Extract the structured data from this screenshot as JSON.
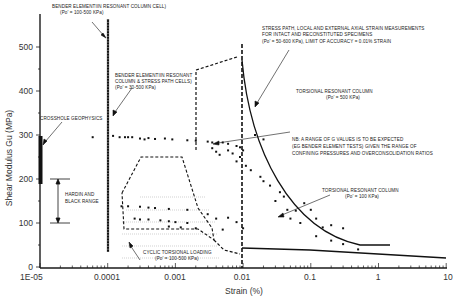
{
  "chart_data": {
    "type": "scatter",
    "title": "",
    "xlabel": "Strain (%)",
    "ylabel": "Shear Modulus Gu (MPa)",
    "xscale": "log",
    "xlim": [
      1e-05,
      10
    ],
    "ylim": [
      0,
      550
    ],
    "x_tick_labels": [
      "1E-05",
      "0.0001",
      "0.001",
      "0.01",
      "0.1",
      "1",
      "10"
    ],
    "y_tick_labels": [
      "0",
      "100",
      "200",
      "300",
      "400",
      "500"
    ],
    "grid": false,
    "legend": "none",
    "series": [
      {
        "name": "Crosshole geophysics",
        "kind": "vertical-bar",
        "x": 1e-05,
        "y_range": [
          180,
          320
        ]
      },
      {
        "name": "Bender element in resonant column cell",
        "kind": "vertical-line",
        "x": 0.0001,
        "y_range": [
          35,
          555
        ]
      },
      {
        "name": "Hardin and Black range",
        "kind": "range-bracket",
        "x": 2e-05,
        "y_range": [
          100,
          200
        ]
      },
      {
        "name": "Stress path (local strain) data",
        "kind": "scatter",
        "points": [
          [
            6e-05,
            295
          ],
          [
            0.00012,
            298
          ],
          [
            0.00015,
            295
          ],
          [
            0.00018,
            295
          ],
          [
            0.0002,
            295
          ],
          [
            0.00023,
            295
          ],
          [
            0.0003,
            292
          ],
          [
            0.00035,
            290
          ],
          [
            0.0004,
            293
          ],
          [
            0.0005,
            291
          ],
          [
            0.0007,
            292
          ],
          [
            0.0009,
            290
          ],
          [
            0.0015,
            288
          ],
          [
            0.002,
            287
          ],
          [
            0.003,
            285
          ],
          [
            0.0035,
            283
          ],
          [
            0.005,
            283
          ],
          [
            0.006,
            280
          ],
          [
            0.008,
            275
          ],
          [
            0.009,
            272
          ],
          [
            0.01,
            265
          ],
          [
            0.0035,
            270
          ],
          [
            0.004,
            262
          ],
          [
            0.006,
            265
          ],
          [
            0.007,
            258
          ],
          [
            0.009,
            250
          ],
          [
            0.008,
            240
          ],
          [
            0.0045,
            255
          ],
          [
            0.011,
            230
          ],
          [
            0.013,
            220
          ]
        ]
      },
      {
        "name": "Cyclic torsional loading",
        "kind": "scatter",
        "points": [
          [
            0.00016,
            138
          ],
          [
            0.0002,
            138
          ],
          [
            0.0003,
            137
          ],
          [
            0.0004,
            135
          ],
          [
            0.0005,
            134
          ],
          [
            0.0008,
            132
          ],
          [
            0.0015,
            130
          ],
          [
            0.00025,
            110
          ],
          [
            0.0003,
            108
          ],
          [
            0.0004,
            108
          ],
          [
            0.0006,
            106
          ],
          [
            0.0008,
            104
          ],
          [
            0.001,
            102
          ],
          [
            0.0015,
            100
          ],
          [
            0.0008,
            92
          ],
          [
            0.0012,
            90
          ],
          [
            0.002,
            88
          ]
        ]
      },
      {
        "name": "Torsional resonant column (Po'=100 kPa) data",
        "kind": "scatter",
        "points": [
          [
            0.003,
            120
          ],
          [
            0.004,
            110
          ],
          [
            0.006,
            112
          ],
          [
            0.008,
            102
          ],
          [
            0.01,
            88
          ],
          [
            0.005,
            85
          ],
          [
            0.015,
            300
          ],
          [
            0.02,
            290
          ],
          [
            0.018,
            205
          ],
          [
            0.02,
            195
          ],
          [
            0.025,
            185
          ],
          [
            0.035,
            170
          ],
          [
            0.04,
            160
          ],
          [
            0.03,
            150
          ],
          [
            0.045,
            130
          ],
          [
            0.06,
            128
          ],
          [
            0.08,
            145
          ],
          [
            0.1,
            130
          ],
          [
            0.05,
            110
          ],
          [
            0.07,
            100
          ],
          [
            0.12,
            110
          ],
          [
            0.15,
            90
          ],
          [
            0.2,
            95
          ],
          [
            0.3,
            88
          ],
          [
            0.12,
            70
          ],
          [
            0.2,
            60
          ],
          [
            0.3,
            52
          ],
          [
            0.5,
            40
          ]
        ]
      },
      {
        "name": "Torsional resonant column (Po'=500 kPa) curve",
        "kind": "line",
        "x": [
          0.013,
          0.02,
          0.05,
          0.1,
          0.3,
          1,
          3
        ],
        "y": [
          460,
          340,
          230,
          160,
          80,
          45,
          35
        ]
      },
      {
        "name": "Torsional resonant column (Po'=100 kPa) curve",
        "kind": "line",
        "x": [
          0.013,
          0.1,
          1,
          10
        ],
        "y": [
          40,
          32,
          25,
          20
        ]
      },
      {
        "name": "Cyclic torsional loading envelope",
        "kind": "dashed-polygon",
        "x": [
          0.00014,
          0.0002,
          0.0012,
          0.004,
          0.013,
          0.005,
          0.0025,
          0.00016
        ],
        "y": [
          190,
          275,
          275,
          100,
          40,
          55,
          85,
          88
        ]
      },
      {
        "name": "Stress path local/external axial strain envelope",
        "kind": "dashed-polygon",
        "x": [
          0.003,
          0.013,
          0.013,
          0.003
        ],
        "y": [
          460,
          490,
          40,
          280
        ]
      }
    ],
    "annotations": [
      "BENDER ELEMENT IN RESONANT COLUMN CELL) (Po' = 100-500 KPa)",
      "BENDER ELEMENT IN RESONANT COLUMN & STRESS PATH CELLS) (Po' = 30-500 KPa)",
      "CROSSHOLE GEOPHYSICS",
      "HARDIN AND BLACK RANGE",
      "STRESS PATH, LOCAL AND EXTERNAL AXIAL STRAIN MEASUREMENTS FOR INTACT AND RECONSTITUTED SPECIMENS (Po' = 50-600 KPa), LIMIT OF ACCURACY = 0.01% STRAIN",
      "TORSIONAL RESONANT COLUMN (Po' = 500 KPa)",
      "NB: A RANGE OF G VALUES IS TO BE EXPECTED (EG BENDER ELEMENT TESTS) GIVEN THE RANGE OF CONFINING PRESSURES AND OVERCONSOLIDATION RATIOS",
      "TORSIONAL RESONANT COLUMN (Po' = 100 KPa)",
      "CYCLIC TORSIONAL LOADING (Po' = 100-500 KPa)"
    ]
  },
  "axes": {
    "x_title": "Strain (%)",
    "y_title": "Shear Modulus Gu (MPa)",
    "x_ticks": [
      "1E-05",
      "0.0001",
      "0.001",
      "0.01",
      "0.1",
      "1",
      "10"
    ],
    "y_ticks": [
      "0",
      "100",
      "200",
      "300",
      "400",
      "500"
    ]
  },
  "labels": {
    "bender_rc_1": "BENDER ELEMENTIIN RESONANT COLUMN CELL)",
    "bender_rc_2": "(Po' = 100-500 KPa)",
    "bender_sp_1": "BENDER ELEMENTIIN RESONANT",
    "bender_sp_2": "COLUMN & STRESS PATH CELLS)",
    "bender_sp_3": "(Po' = 30-500 KPa)",
    "crosshole": "CROSSHOLE GEOPHYSICS",
    "hardin_1": "HARDIN AND",
    "hardin_2": "BLACK RANGE",
    "stress_1": "STRESS PATH, LOCAL AND EXTERNAL AXIAL STRAIN MEASUREMENTS",
    "stress_2": "FOR INTACT AND RECONSTITUTED SPECIMENS",
    "stress_3": "(Po' = 50-600 KPa), LIMIT OF ACCURACY = 0.01% STRAIN",
    "trc500_1": "TORSIONAL RESONANT COLUMN",
    "trc500_2": "(Po' = 500 KPa)",
    "nb_1": "NB: A RANGE OF G VALUES IS TO BE EXPECTED",
    "nb_2": "(EG BENDER ELEMENT TESTS) GIVEN THE RANGE OF",
    "nb_3": "CONFINING PRESSURES AND OVERCONSOLIDATION RATIOS",
    "trc100_1": "TORSIONAL RESONANT COLUMN",
    "trc100_2": "(Po' = 100 KPa)",
    "cyclic_1": "CYCLIC TORSIONAL LOADING",
    "cyclic_2": "(Po' = 100-500 KPa)"
  }
}
